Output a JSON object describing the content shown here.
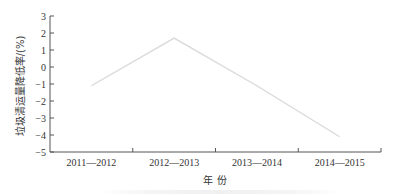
{
  "chart_data": {
    "type": "line",
    "title": "",
    "xlabel": "年 份",
    "ylabel": "垃圾清运量降低率/(%)",
    "categories": [
      "2011—2012",
      "2012—2013",
      "2013—2014",
      "2014—2015"
    ],
    "series": [
      {
        "name": "垃圾清运量降低率",
        "values": [
          -1.1,
          1.7,
          -1.1,
          -4.1
        ],
        "color": "#d9d9d9"
      }
    ],
    "ylim": [
      -5,
      3
    ],
    "yticks": [
      3,
      2,
      1,
      0,
      -1,
      -2,
      -3,
      -4,
      -5
    ],
    "grid": false,
    "legend": "none"
  },
  "labels": {
    "x_axis_title": "年 份",
    "y_axis_title": "垃圾清运量降低率/(%)"
  }
}
